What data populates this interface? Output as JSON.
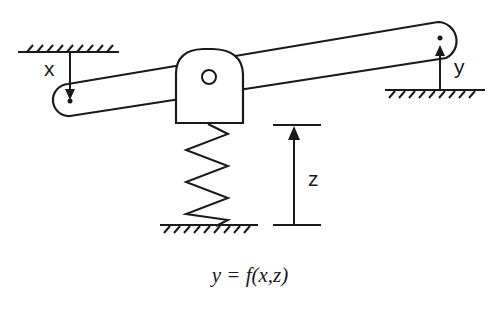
{
  "diagram": {
    "labels": {
      "x": "x",
      "y": "y",
      "z": "z"
    },
    "equation": "y = f(x,z)",
    "components": [
      "lever-arm",
      "pivot-block",
      "pivot-pin",
      "spring",
      "ground-left-top",
      "ground-right",
      "ground-bottom",
      "input-arrow-x",
      "output-arrow-y",
      "dimension-z"
    ],
    "colors": {
      "stroke": "#1a1a1a",
      "background": "#ffffff"
    }
  }
}
